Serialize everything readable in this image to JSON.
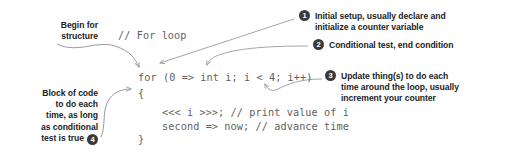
{
  "figure": {
    "kind": "annotated-code-diagram",
    "colors": {
      "background": "#ffffff",
      "code_text": "#5f5f5f",
      "annotation_text": "#1c1c1c",
      "badge_fill": "#3a3a3a",
      "badge_text": "#ffffff",
      "arrow_stroke": "#9a9a9a"
    }
  },
  "code": {
    "comment_line": "// For loop",
    "for_line": "for (0 => int i; i < 4; i++)",
    "brace_open": "{",
    "body_line_1": "<<< i >>>; // print value of i",
    "body_line_2": "second => now; // advance time",
    "brace_close": "}"
  },
  "annotations": {
    "begin": {
      "line1": "Begin for",
      "line2": "structure"
    },
    "block": {
      "line1": "Block of code",
      "line2": "to do each",
      "line3": "time, as long",
      "line4": "as conditional",
      "line5": "test is true",
      "number": "4"
    },
    "one": {
      "number": "1",
      "line1": "Initial setup, usually declare and",
      "line2": "initialize a counter variable"
    },
    "two": {
      "number": "2",
      "line1": "Conditional test, end condition"
    },
    "three": {
      "number": "3",
      "line1": "Update thing(s) to do each",
      "line2": "time around the loop, usually",
      "line3": "increment your counter"
    }
  }
}
